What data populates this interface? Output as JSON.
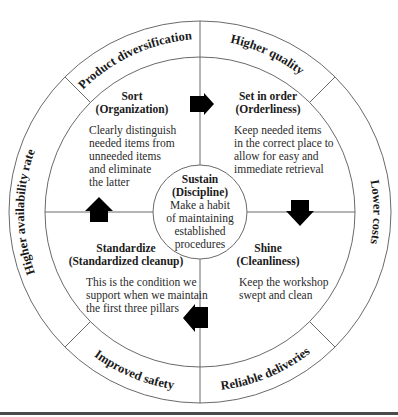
{
  "diagram": {
    "ring_labels": {
      "top_left": "Product diversification",
      "top_right": "Higher quality",
      "right": "Lower costs",
      "bottom_right": "Reliable deliveries",
      "bottom_left": "Improved safety",
      "left": "Higher availability rate"
    },
    "quadrants": {
      "sort": {
        "title": "Sort",
        "subtitle": "(Organization)",
        "lines": [
          "Clearly distinguish",
          "needed items from",
          "unneeded items",
          "and eliminate",
          "the latter"
        ]
      },
      "set_in_order": {
        "title": "Set in order",
        "subtitle": "(Orderliness)",
        "lines": [
          "Keep needed items",
          "in the correct place to",
          "allow for easy and",
          "immediate retrieval"
        ]
      },
      "shine": {
        "title": "Shine",
        "subtitle": "(Cleanliness)",
        "lines": [
          "Keep the workshop",
          "swept and clean"
        ]
      },
      "standardize": {
        "title": "Standardize",
        "subtitle": "(Standardized cleanup)",
        "lines": [
          "This is the condition we",
          "support when we maintain",
          "the first three pillars"
        ]
      }
    },
    "center": {
      "title": "Sustain",
      "subtitle": "(Discipline)",
      "lines": [
        "Make a habit",
        "of maintaining",
        "established",
        "procedures"
      ]
    },
    "arrows": [
      "arrow-right",
      "arrow-down",
      "arrow-left",
      "arrow-up"
    ],
    "colors": {
      "line": "#6a6a6a",
      "arrow": "#000000",
      "text": "#1a1a1a"
    }
  }
}
